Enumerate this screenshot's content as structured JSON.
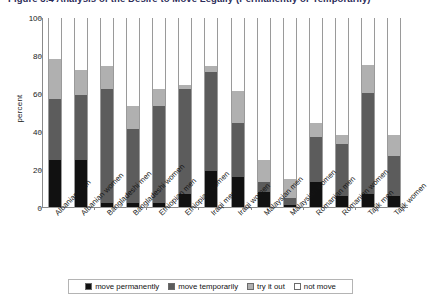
{
  "figure": {
    "title_clipped": "Figure 3.4   Analysis of the Desire to Move Legally (Permanently or Temporarily)",
    "ylabel": "percent"
  },
  "axes": {
    "yticks": [
      0,
      20,
      40,
      60,
      80,
      100
    ],
    "ylim": [
      0,
      100
    ],
    "grid": false
  },
  "legend": {
    "position": "bottom",
    "items": [
      {
        "label": "move permanently",
        "color": "#111111"
      },
      {
        "label": "move temporarily",
        "color": "#5c5c5c"
      },
      {
        "label": "try it out",
        "color": "#b0b0b0"
      },
      {
        "label": "not move",
        "color": "#ffffff"
      }
    ]
  },
  "chart_data": {
    "type": "bar",
    "subtype": "stacked-100",
    "title": "Figure 3.4   Analysis of the Desire to Move Legally (Permanently or Temporarily)",
    "xlabel": "",
    "ylabel": "percent",
    "ylim": [
      0,
      100
    ],
    "yticks": [
      0,
      20,
      40,
      60,
      80,
      100
    ],
    "grid": false,
    "legend_position": "bottom",
    "categories": [
      "Albanian men",
      "Albanian women",
      "Bangladeshi men",
      "Bangladeshi women",
      "Ethiopian men",
      "Ethiopian women",
      "Iraqi men",
      "Iraqi women",
      "Malaysian men",
      "Malaysian women",
      "Romanian men",
      "Romanian women",
      "Tajik men",
      "Tajik women"
    ],
    "series": [
      {
        "name": "move permanently",
        "color": "#111111",
        "values": [
          25,
          25,
          2,
          2,
          2,
          7,
          19,
          16,
          8,
          1,
          13,
          6,
          7,
          6
        ]
      },
      {
        "name": "move temporarily",
        "color": "#5c5c5c",
        "values": [
          32,
          34,
          60,
          39,
          51,
          55,
          52,
          28,
          5,
          4,
          24,
          27,
          53,
          21
        ]
      },
      {
        "name": "try it out",
        "color": "#b0b0b0",
        "values": [
          21,
          13,
          12,
          12,
          9,
          2,
          3,
          17,
          12,
          10,
          7,
          5,
          15,
          11
        ]
      },
      {
        "name": "not move",
        "color": "#ffffff",
        "values": [
          22,
          28,
          26,
          47,
          38,
          36,
          26,
          39,
          75,
          85,
          56,
          62,
          25,
          62
        ]
      }
    ],
    "cumulative_tops": {
      "move permanently": [
        25,
        25,
        2,
        2,
        2,
        7,
        19,
        16,
        8,
        1,
        13,
        6,
        7,
        6
      ],
      "move temporarily": [
        57,
        59,
        62,
        41,
        53,
        62,
        71,
        44,
        13,
        5,
        37,
        33,
        60,
        27
      ],
      "try it out": [
        78,
        72,
        74,
        53,
        62,
        64,
        74,
        61,
        25,
        15,
        44,
        38,
        75,
        38
      ],
      "not move": [
        100,
        100,
        100,
        100,
        100,
        100,
        100,
        100,
        100,
        100,
        100,
        100,
        100,
        100
      ]
    }
  }
}
